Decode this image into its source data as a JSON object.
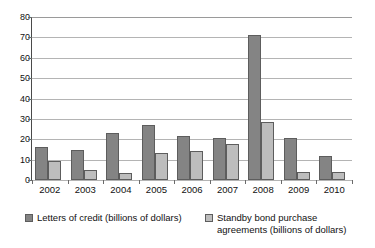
{
  "chart_data": {
    "type": "bar",
    "title": "",
    "subtitle": "",
    "xlabel": "",
    "ylabel": "",
    "categories": [
      "2002",
      "2003",
      "2004",
      "2005",
      "2006",
      "2007",
      "2008",
      "2009",
      "2010"
    ],
    "series": [
      {
        "name": "Letters of credit (billions of dollars)",
        "color": "#848484",
        "values": [
          16,
          14.5,
          23.3,
          27.1,
          21.4,
          20.7,
          71.2,
          20.7,
          11.8
        ]
      },
      {
        "name": "Standby bond purchase agreements (billions of dollars)",
        "color": "#bdbdbd",
        "values": [
          9.5,
          4.8,
          3.4,
          13.1,
          14.1,
          17.8,
          28.4,
          4.1,
          4.0
        ]
      }
    ],
    "ylim": [
      0,
      80
    ],
    "y_ticks": [
      0,
      10,
      20,
      30,
      40,
      50,
      60,
      70,
      80
    ],
    "y_tick_labels": [
      "0",
      "10",
      "20",
      "30",
      "40",
      "50",
      "60",
      "70",
      "80"
    ],
    "grid": "horizontal",
    "legend_position": "bottom"
  },
  "legend": {
    "entries": [
      {
        "label": "Letters of credit (billions of dollars)"
      },
      {
        "label": "Standby bond purchase\nagreements (billions of dollars)"
      }
    ]
  }
}
